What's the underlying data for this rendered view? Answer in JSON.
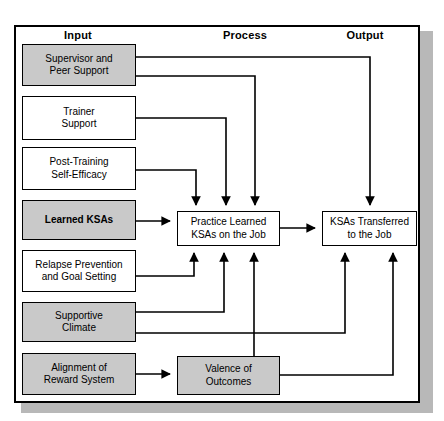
{
  "diagram": {
    "columns": [
      {
        "id": "input",
        "label": "Input"
      },
      {
        "id": "process",
        "label": "Process"
      },
      {
        "id": "output",
        "label": "Output"
      }
    ],
    "colors": {
      "shaded_fill": "#c9c9c9",
      "plain_fill": "#ffffff",
      "stroke": "#000000",
      "frame_shadow": "#b8b8b8",
      "background": "#ffffff"
    },
    "nodes": [
      {
        "id": "supervisor_peer_support",
        "label": "Supervisor and\nPeer Support",
        "column": "input",
        "style": "shaded",
        "bold": false,
        "x": 22,
        "y": 44,
        "w": 114,
        "h": 42
      },
      {
        "id": "trainer_support",
        "label": "Trainer\nSupport",
        "column": "input",
        "style": "plain",
        "bold": false,
        "x": 22,
        "y": 96,
        "w": 114,
        "h": 44
      },
      {
        "id": "post_training_self_efficacy",
        "label": "Post-Training\nSelf-Efficacy",
        "column": "input",
        "style": "plain",
        "bold": false,
        "x": 22,
        "y": 147,
        "w": 114,
        "h": 43
      },
      {
        "id": "learned_ksas",
        "label": "Learned KSAs",
        "column": "input",
        "style": "shaded",
        "bold": true,
        "x": 22,
        "y": 200,
        "w": 114,
        "h": 40
      },
      {
        "id": "relapse_prevention",
        "label": "Relapse Prevention\nand Goal Setting",
        "column": "input",
        "style": "plain",
        "bold": false,
        "x": 22,
        "y": 250,
        "w": 114,
        "h": 42
      },
      {
        "id": "supportive_climate",
        "label": "Supportive\nClimate",
        "column": "input",
        "style": "shaded",
        "bold": false,
        "x": 22,
        "y": 302,
        "w": 114,
        "h": 40
      },
      {
        "id": "alignment_reward_system",
        "label": "Alignment of\nReward System",
        "column": "input",
        "style": "shaded",
        "bold": false,
        "x": 22,
        "y": 353,
        "w": 114,
        "h": 42
      },
      {
        "id": "practice_learned_ksas",
        "label": "Practice Learned\nKSAs on the Job",
        "column": "process",
        "style": "plain",
        "bold": false,
        "x": 177,
        "y": 211,
        "w": 103,
        "h": 35
      },
      {
        "id": "valence_of_outcomes",
        "label": "Valence of\nOutcomes",
        "column": "process",
        "style": "shaded",
        "bold": false,
        "x": 177,
        "y": 356,
        "w": 103,
        "h": 39
      },
      {
        "id": "ksas_transferred",
        "label": "KSAs Transferred\nto the Job",
        "column": "output",
        "style": "plain",
        "bold": false,
        "x": 322,
        "y": 211,
        "w": 95,
        "h": 35
      }
    ],
    "edges": [
      {
        "from": "supervisor_peer_support",
        "to": "ksas_transferred",
        "note": "top route to output box"
      },
      {
        "from": "supervisor_peer_support",
        "to": "practice_learned_ksas",
        "note": "down arrow, rightmost of three"
      },
      {
        "from": "trainer_support",
        "to": "practice_learned_ksas",
        "note": "down arrow, middle of three"
      },
      {
        "from": "post_training_self_efficacy",
        "to": "practice_learned_ksas",
        "note": "down arrow, leftmost of three"
      },
      {
        "from": "learned_ksas",
        "to": "practice_learned_ksas",
        "note": "direct horizontal arrow"
      },
      {
        "from": "relapse_prevention",
        "to": "practice_learned_ksas",
        "note": "up arrow, leftmost of three"
      },
      {
        "from": "supportive_climate",
        "to": "practice_learned_ksas",
        "note": "up arrow, middle of three"
      },
      {
        "from": "supportive_climate",
        "to": "ksas_transferred",
        "note": "lower route to output box"
      },
      {
        "from": "alignment_reward_system",
        "to": "valence_of_outcomes",
        "note": "direct horizontal arrow"
      },
      {
        "from": "valence_of_outcomes",
        "to": "practice_learned_ksas",
        "note": "up arrow, rightmost of three"
      },
      {
        "from": "valence_of_outcomes",
        "to": "ksas_transferred",
        "note": "right route up to output box"
      },
      {
        "from": "practice_learned_ksas",
        "to": "ksas_transferred",
        "note": "direct horizontal arrow"
      }
    ]
  }
}
